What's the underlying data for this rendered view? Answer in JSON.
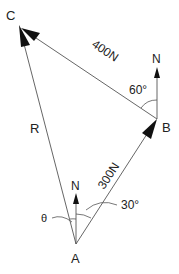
{
  "diagram": {
    "type": "vector-triangle",
    "points": {
      "A": {
        "label": "A",
        "x": 76,
        "y": 244
      },
      "B": {
        "label": "B",
        "x": 157,
        "y": 119
      },
      "C": {
        "label": "C",
        "x": 19,
        "y": 25
      }
    },
    "vectors": [
      {
        "from": "A",
        "to": "B",
        "label": "300N",
        "magnitude": "300N"
      },
      {
        "from": "B",
        "to": "C",
        "label": "400N",
        "magnitude": "400N"
      },
      {
        "from": "A",
        "to": "C",
        "label": "R"
      }
    ],
    "north_arrows": [
      {
        "at": "A",
        "label": "N"
      },
      {
        "at": "B",
        "label": "N"
      }
    ],
    "angles": [
      {
        "at": "A",
        "label": "30°"
      },
      {
        "at": "A",
        "label": "θ"
      },
      {
        "at": "B",
        "label": "60°"
      }
    ]
  },
  "labels": {
    "A": "A",
    "B": "B",
    "C": "C",
    "R": "R",
    "force_AB": "300N",
    "force_BC": "400N",
    "north_A": "N",
    "north_B": "N",
    "angle_A": "30°",
    "angle_B": "60°",
    "theta": "θ"
  },
  "colors": {
    "line": "#555555",
    "arrowhead": "#111111",
    "text": "#222222",
    "background": "#ffffff"
  }
}
